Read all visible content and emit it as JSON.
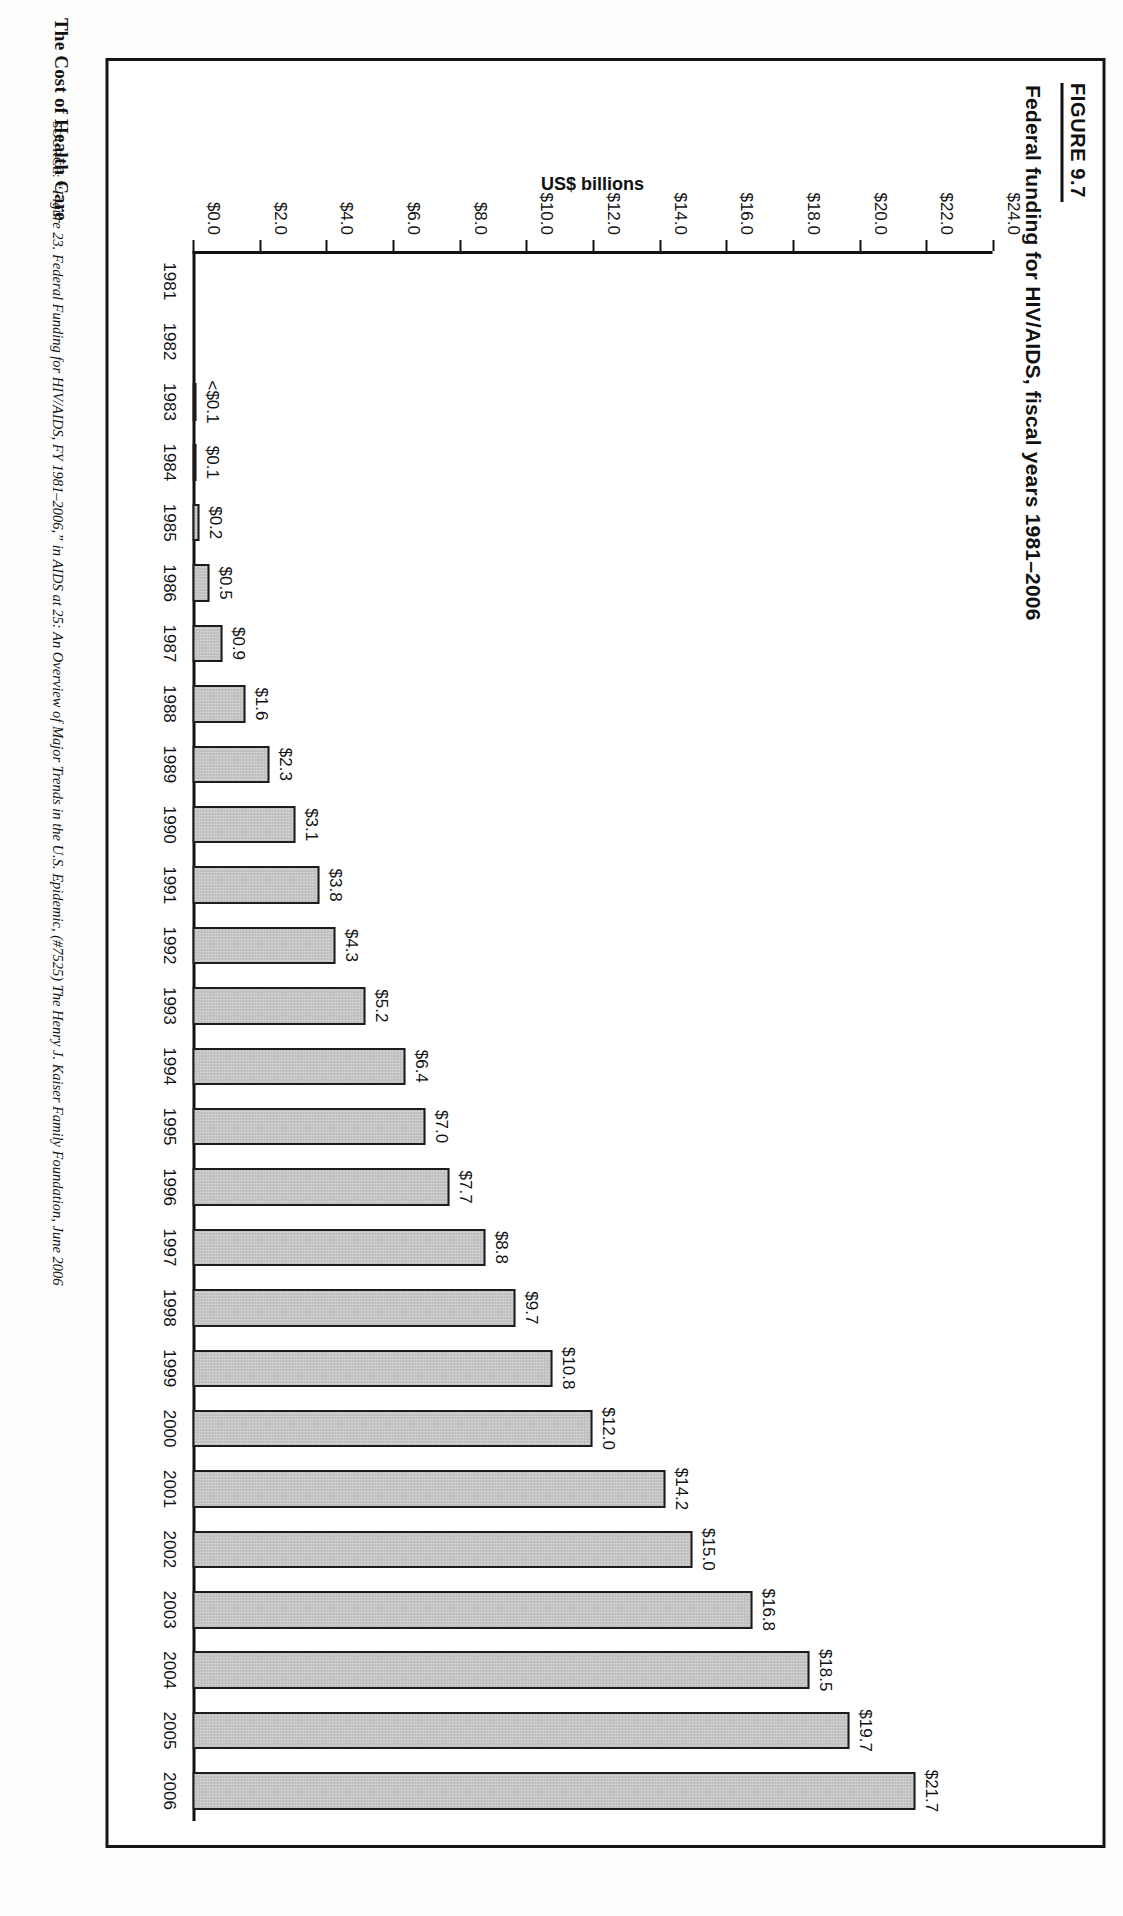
{
  "page": {
    "running_head": "The Cost of Health Care",
    "figure_number": "FIGURE 9.7"
  },
  "figure": {
    "title": "Federal funding for HIV/AIDS, fiscal years 1981–2006",
    "source_lead": "SOURCE:",
    "source_text": "“Figure 23. Federal Funding for HIV/AIDS, FY 1981–2006,” in AIDS at 25: An Overview of Major Trends in the U.S. Epidemic, (#7525) The Henry J. Kaiser Family Foundation, June 2006"
  },
  "chart_data": {
    "type": "bar",
    "title": "Federal funding for HIV/AIDS, fiscal years 1981–2006",
    "xlabel": "",
    "ylabel": "US$ billions",
    "ylim": [
      0,
      24
    ],
    "grid": false,
    "legend": null,
    "categories": [
      "1981",
      "1982",
      "1983",
      "1984",
      "1985",
      "1986",
      "1987",
      "1988",
      "1989",
      "1990",
      "1991",
      "1992",
      "1993",
      "1994",
      "1995",
      "1996",
      "1997",
      "1998",
      "1999",
      "2000",
      "2001",
      "2002",
      "2003",
      "2004",
      "2005",
      "2006"
    ],
    "values": [
      0,
      0,
      0.05,
      0.1,
      0.2,
      0.5,
      0.9,
      1.6,
      2.3,
      3.1,
      3.8,
      4.3,
      5.2,
      6.4,
      7.0,
      7.7,
      8.8,
      9.7,
      10.8,
      12.0,
      14.2,
      15.0,
      16.8,
      18.5,
      19.7,
      21.7
    ],
    "data_labels": [
      "",
      "",
      "<$0.1",
      "$0.1",
      "$0.2",
      "$0.5",
      "$0.9",
      "$1.6",
      "$2.3",
      "$3.1",
      "$3.8",
      "$4.3",
      "$5.2",
      "$6.4",
      "$7.0",
      "$7.7",
      "$8.8",
      "$9.7",
      "$10.8",
      "$12.0",
      "$14.2",
      "$15.0",
      "$16.8",
      "$18.5",
      "$19.7",
      "$21.7"
    ],
    "ytick_values": [
      0,
      2,
      4,
      6,
      8,
      10,
      12,
      14,
      16,
      18,
      20,
      22,
      24
    ],
    "ytick_labels": [
      "$0.0",
      "$2.0",
      "$4.0",
      "$6.0",
      "$8.0",
      "$10.0",
      "$12.0",
      "$14.0",
      "$16.0",
      "$18.0",
      "$20.0",
      "$22.0",
      "$24.0"
    ],
    "bar_fill": "#c3c3c3",
    "bar_stroke": "#1d1d1d"
  }
}
